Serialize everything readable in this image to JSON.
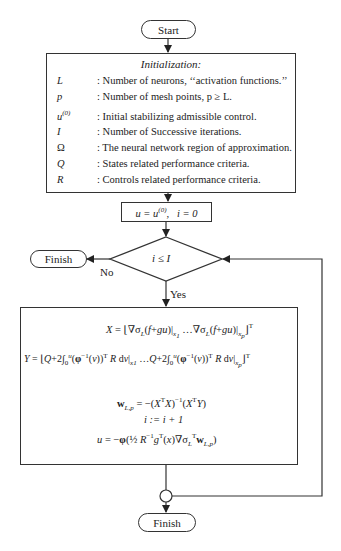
{
  "start": {
    "label": "Start"
  },
  "initialization": {
    "title": "Initialization:",
    "rows": [
      {
        "symbol": "L",
        "description": ": Number of neurons, ‘‘activation functions.’’"
      },
      {
        "symbol": "p",
        "description": ": Number of mesh points, p ≥ L."
      },
      {
        "symbol": "u(0)",
        "description": ": Initial stabilizing admissible control."
      },
      {
        "symbol": "I",
        "description": ": Number of Successive iterations."
      },
      {
        "symbol": "Ω",
        "description": ": The neural network region of approximation."
      },
      {
        "symbol": "Q",
        "description": ": States related performance criteria."
      },
      {
        "symbol": "R",
        "description": ": Controls related performance criteria."
      }
    ]
  },
  "assign": {
    "text": "u = u(0),  i = 0"
  },
  "decision": {
    "condition": "i ≤ I",
    "no_label": "No",
    "yes_label": "Yes"
  },
  "finish_left": {
    "label": "Finish"
  },
  "compute": {
    "eq_x": "X = ⌊∇σL(f+gu)|x1 …∇σL(f+gu)|xp⌋T",
    "eq_y": "Y = ⌊Q + 2∫0u(φ−1(v))T R dv|x1 …Q + 2∫0u(φ−1(v))T R dv|xp⌋T",
    "eq_w": "wL,p = −(XTX)−1(XTY)",
    "eq_i": "i := i + 1",
    "eq_u": "u = −φ(½ R−1gT(x)∇σLT wL,p)"
  },
  "finish_bottom": {
    "label": "Finish"
  }
}
